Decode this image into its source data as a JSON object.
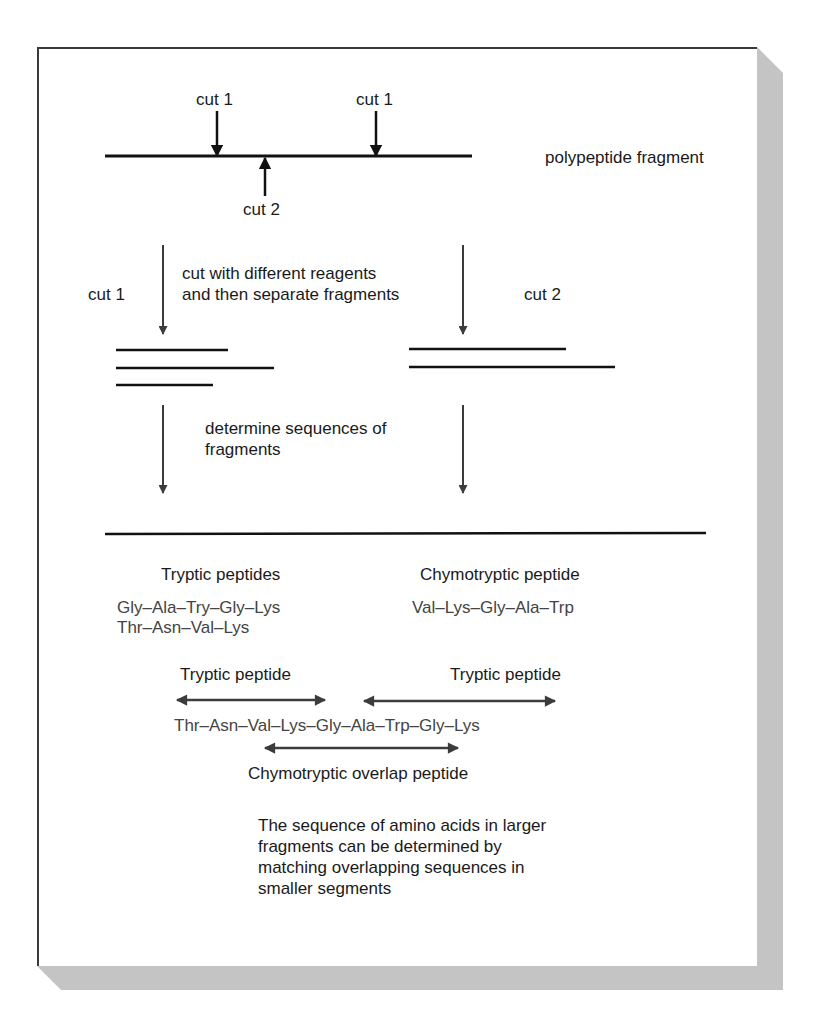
{
  "diagram": {
    "top": {
      "cut1_left_label": "cut 1",
      "cut1_right_label": "cut 1",
      "cut2_label": "cut 2",
      "fragment_label": "polypeptide fragment"
    },
    "split": {
      "left_label": "cut 1",
      "right_label": "cut 2",
      "step1_line1": "cut with different reagents",
      "step1_line2": "and then separate fragments",
      "step2_line1": "determine sequences of",
      "step2_line2": "fragments"
    },
    "results": {
      "tryptic_heading": "Tryptic peptides",
      "tryptic_seq_1": "Gly–Ala–Try–Gly–Lys",
      "tryptic_seq_2": "Thr–Asn–Val–Lys",
      "chymo_heading": "Chymotryptic peptide",
      "chymo_seq": "Val–Lys–Gly–Ala–Trp"
    },
    "overlap": {
      "left_arrow_label": "Tryptic peptide",
      "right_arrow_label": "Tryptic peptide",
      "full_sequence": "Thr–Asn–Val–Lys–Gly–Ala–Trp–Gly–Lys",
      "bottom_arrow_label": "Chymotryptic overlap peptide"
    },
    "caption": "The sequence of amino acids in larger fragments can be determined by matching overlapping sequences in smaller segments",
    "colors": {
      "line": "#111111",
      "arrow_gray": "#3c3c3c",
      "shadow": "#c4c4c4"
    }
  }
}
